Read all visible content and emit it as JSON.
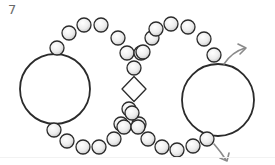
{
  "step": {
    "number": "7"
  },
  "colors": {
    "outline": "#2b2b2b",
    "bead_fill_light": "#ffffff",
    "bead_fill_dark": "#c8c8c8",
    "arrow": "#8a8a8a",
    "background": "#ffffff"
  },
  "diagram": {
    "large_rings": [
      {
        "name": "left-ring",
        "cx": 55,
        "cy": 89,
        "r": 35
      },
      {
        "name": "right-ring",
        "cx": 218,
        "cy": 100,
        "r": 36
      }
    ],
    "center_diamond": {
      "cx": 134,
      "cy": 89,
      "w": 24,
      "h": 25
    },
    "bead_radius": 7,
    "beads": [
      [
        57,
        48
      ],
      [
        69,
        33
      ],
      [
        84,
        25
      ],
      [
        101,
        25
      ],
      [
        118,
        38
      ],
      [
        127,
        53
      ],
      [
        141,
        53
      ],
      [
        134,
        68
      ],
      [
        129,
        109
      ],
      [
        121,
        124
      ],
      [
        139,
        124
      ],
      [
        152,
        38
      ],
      [
        143,
        52
      ],
      [
        156,
        29
      ],
      [
        171,
        24
      ],
      [
        188,
        27
      ],
      [
        204,
        39
      ],
      [
        214,
        55
      ],
      [
        54,
        130
      ],
      [
        67,
        141
      ],
      [
        83,
        147
      ],
      [
        99,
        147
      ],
      [
        114,
        139
      ],
      [
        124,
        127
      ],
      [
        132,
        113
      ],
      [
        138,
        127
      ],
      [
        148,
        139
      ],
      [
        162,
        147
      ],
      [
        177,
        150
      ],
      [
        193,
        146
      ],
      [
        207,
        139
      ]
    ],
    "arrows": [
      {
        "name": "arrow-up-right",
        "path": "M 224 64 Q 232 52 245 48",
        "head": "M 238 44 L 246 48 L 240 54"
      },
      {
        "name": "arrow-down-right",
        "path": "M 214 144 Q 221 152 226 160",
        "head": "M 220 158 L 227 161 L 229 153"
      }
    ]
  }
}
